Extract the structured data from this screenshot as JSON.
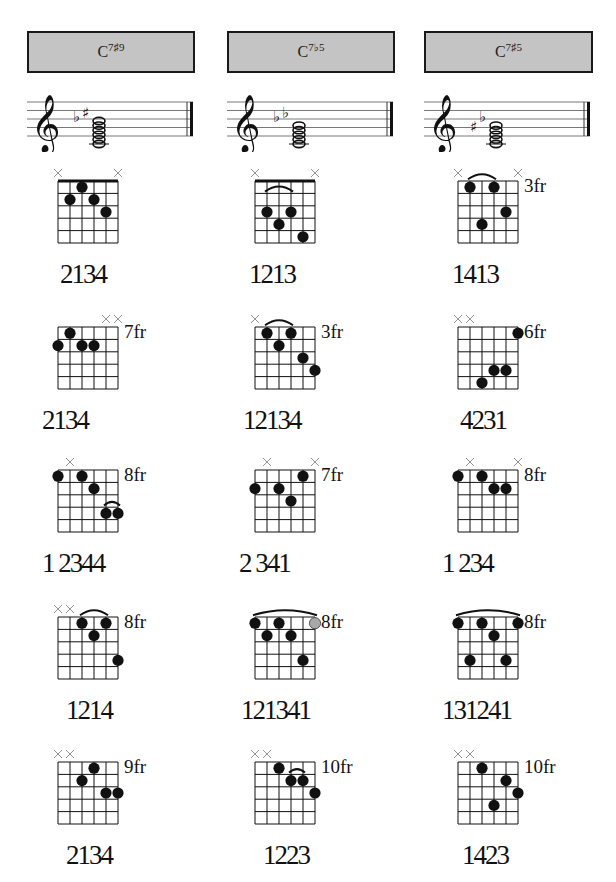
{
  "chords": [
    {
      "name": "C",
      "ext": "7♯9",
      "staff_accidentals": "♭♯",
      "diagrams": [
        {
          "mutes": [
            0,
            5
          ],
          "fret_label": "",
          "nut": true,
          "dots": [
            [
              1,
              2
            ],
            [
              2,
              1
            ],
            [
              3,
              2
            ],
            [
              4,
              3
            ]
          ],
          "barres": [],
          "fingering": "2134",
          "fx": 36
        },
        {
          "mutes": [
            4,
            5
          ],
          "fret_label": "7fr",
          "nut": false,
          "dots": [
            [
              0,
              2
            ],
            [
              1,
              1
            ],
            [
              2,
              2
            ],
            [
              3,
              2
            ]
          ],
          "barres": [],
          "fingering": "2134",
          "fx": 18
        },
        {
          "mutes": [
            1
          ],
          "fret_label": "8fr",
          "nut": false,
          "dots": [
            [
              0,
              1
            ],
            [
              2,
              1
            ],
            [
              3,
              2
            ],
            [
              4,
              4
            ],
            [
              5,
              4
            ]
          ],
          "barres": [
            [
              4,
              5,
              4
            ]
          ],
          "fingering": "1 2344",
          "fx": 18
        },
        {
          "mutes": [
            0,
            1
          ],
          "fret_label": "8fr",
          "nut": false,
          "dots": [
            [
              2,
              1
            ],
            [
              3,
              2
            ],
            [
              4,
              1
            ],
            [
              5,
              4
            ]
          ],
          "barres": [
            [
              2,
              4,
              1
            ]
          ],
          "fingering": "1214",
          "fx": 42
        },
        {
          "mutes": [
            0,
            1
          ],
          "fret_label": "9fr",
          "nut": false,
          "dots": [
            [
              2,
              2
            ],
            [
              3,
              1
            ],
            [
              4,
              3
            ],
            [
              5,
              3
            ]
          ],
          "barres": [],
          "fingering": "2134",
          "fx": 42
        }
      ]
    },
    {
      "name": "C",
      "ext": "7♭5",
      "staff_accidentals": "♭♭",
      "diagrams": [
        {
          "mutes": [
            0,
            5
          ],
          "fret_label": "",
          "nut": true,
          "dots": [
            [
              1,
              3
            ],
            [
              2,
              4
            ],
            [
              3,
              3
            ],
            [
              4,
              5
            ]
          ],
          "barres": [
            [
              1,
              3,
              2
            ]
          ],
          "fingering": "1213",
          "fx": 28
        },
        {
          "mutes": [
            0
          ],
          "fret_label": "3fr",
          "nut": false,
          "dots": [
            [
              1,
              1
            ],
            [
              2,
              2
            ],
            [
              3,
              1
            ],
            [
              4,
              3
            ],
            [
              5,
              4
            ]
          ],
          "barres": [
            [
              1,
              3,
              1
            ]
          ],
          "fingering": "12134",
          "fx": 22
        },
        {
          "mutes": [
            1,
            5
          ],
          "fret_label": "7fr",
          "nut": false,
          "dots": [
            [
              0,
              2
            ],
            [
              2,
              2
            ],
            [
              3,
              3
            ],
            [
              4,
              1
            ]
          ],
          "barres": [],
          "fingering": "2 341",
          "fx": 18
        },
        {
          "mutes": [],
          "fret_label": "8fr",
          "nut": false,
          "dots": [
            [
              0,
              1
            ],
            [
              1,
              2
            ],
            [
              2,
              1
            ],
            [
              3,
              2
            ],
            [
              4,
              4
            ],
            [
              5,
              1,
              "gray"
            ]
          ],
          "barres": [
            [
              0,
              5,
              1
            ]
          ],
          "fingering": "121341",
          "fx": 20
        },
        {
          "mutes": [
            0,
            1
          ],
          "fret_label": "10fr",
          "nut": false,
          "dots": [
            [
              2,
              1
            ],
            [
              3,
              2
            ],
            [
              4,
              2
            ],
            [
              5,
              3
            ]
          ],
          "barres": [
            [
              3,
              4,
              2
            ]
          ],
          "fingering": "1223",
          "fx": 42
        }
      ]
    },
    {
      "name": "C",
      "ext": "7♯5",
      "staff_accidentals": "♯♭",
      "diagrams": [
        {
          "mutes": [
            0,
            5
          ],
          "fret_label": "3fr",
          "nut": false,
          "dots": [
            [
              1,
              1
            ],
            [
              2,
              4
            ],
            [
              3,
              1
            ],
            [
              4,
              3
            ]
          ],
          "barres": [
            [
              1,
              3,
              1
            ]
          ],
          "fingering": "1413",
          "fx": 28
        },
        {
          "mutes": [
            0,
            1
          ],
          "fret_label": "6fr",
          "nut": false,
          "dots": [
            [
              2,
              5
            ],
            [
              3,
              4
            ],
            [
              4,
              4
            ],
            [
              5,
              1
            ]
          ],
          "barres": [],
          "fingering": "4231",
          "fx": 36
        },
        {
          "mutes": [
            1,
            5
          ],
          "fret_label": "8fr",
          "nut": false,
          "dots": [
            [
              0,
              1
            ],
            [
              2,
              1
            ],
            [
              3,
              2
            ],
            [
              4,
              2
            ]
          ],
          "barres": [],
          "fingering": "1 234",
          "fx": 18
        },
        {
          "mutes": [],
          "fret_label": "8fr",
          "nut": false,
          "dots": [
            [
              0,
              1
            ],
            [
              1,
              4
            ],
            [
              2,
              1
            ],
            [
              3,
              2
            ],
            [
              4,
              4
            ],
            [
              5,
              1
            ]
          ],
          "barres": [
            [
              0,
              5,
              1
            ]
          ],
          "fingering": "131241",
          "fx": 18
        },
        {
          "mutes": [
            0,
            1
          ],
          "fret_label": "10fr",
          "nut": false,
          "dots": [
            [
              2,
              1
            ],
            [
              3,
              4
            ],
            [
              4,
              2
            ],
            [
              5,
              3
            ]
          ],
          "barres": [],
          "fingering": "1423",
          "fx": 38
        }
      ]
    }
  ],
  "colors": {
    "header_bg": "#c4c4c4",
    "ink": "#111111",
    "mute": "#888888",
    "gray_dot": "#a8a8a8"
  }
}
